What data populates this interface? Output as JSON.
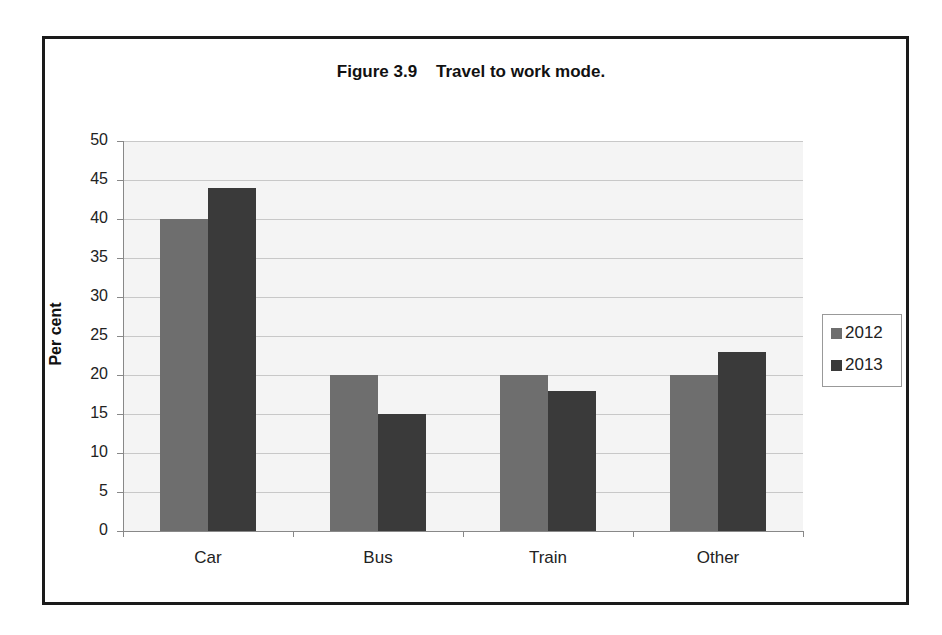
{
  "chart_data": {
    "type": "bar",
    "title": "Figure 3.9    Travel to work mode.",
    "xlabel": "",
    "ylabel": "Per cent",
    "ylim": [
      0,
      50
    ],
    "yticks": [
      "0",
      "5",
      "10",
      "15",
      "20",
      "25",
      "30",
      "35",
      "40",
      "45",
      "50"
    ],
    "grid": true,
    "legend_position": "right",
    "categories": [
      "Car",
      "Bus",
      "Train",
      "Other"
    ],
    "series": [
      {
        "name": "2012",
        "values": [
          40,
          20,
          20,
          20
        ],
        "color": "#6e6e6e"
      },
      {
        "name": "2013",
        "values": [
          44,
          15,
          18,
          23
        ],
        "color": "#3a3a3a"
      }
    ]
  }
}
